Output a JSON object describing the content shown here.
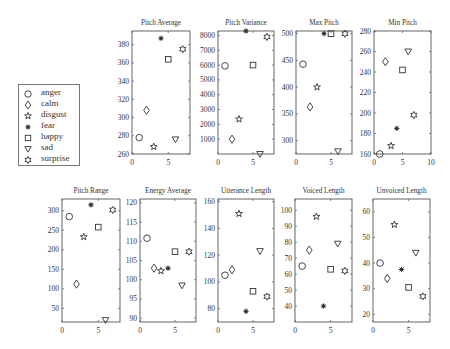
{
  "chart_data": {
    "type": "scatter",
    "layout": "small-multiples 2x5 (top row 4 panels, bottom row 5 panels)",
    "legend": {
      "position": "left",
      "entries": [
        {
          "name": "anger",
          "marker": "circle"
        },
        {
          "name": "calm",
          "marker": "diamond"
        },
        {
          "name": "disgust",
          "marker": "star"
        },
        {
          "name": "fear",
          "marker": "asterisk"
        },
        {
          "name": "happy",
          "marker": "square"
        },
        {
          "name": "sad",
          "marker": "triangle-down"
        },
        {
          "name": "surprise",
          "marker": "hexagram"
        }
      ]
    },
    "x_categories": {
      "anger": 1,
      "calm": 2,
      "disgust": 3,
      "fear": 4,
      "happy": 5,
      "sad": 6,
      "surprise": 7
    },
    "panels": [
      {
        "title": "Pitch Average",
        "xlim": [
          0,
          8
        ],
        "xticks": [
          0,
          5
        ],
        "ylim": [
          260,
          395
        ],
        "yticks": [
          260,
          280,
          300,
          320,
          340,
          360,
          380
        ],
        "points": {
          "anger": 278,
          "calm": 308,
          "disgust": 268,
          "fear": 387,
          "happy": 364,
          "sad": 276,
          "surprise": 375
        }
      },
      {
        "title": "Pitch Variance",
        "xlim": [
          0,
          8
        ],
        "xticks": [
          0,
          5
        ],
        "ylim": [
          0,
          8300
        ],
        "yticks": [
          1000,
          2000,
          3000,
          4000,
          5000,
          6000,
          7000,
          8000
        ],
        "points": {
          "anger": 5950,
          "calm": 1000,
          "disgust": 2350,
          "fear": 8300,
          "happy": 6000,
          "sad": 0,
          "surprise": 7900
        }
      },
      {
        "title": "Max Pitch",
        "xlim": [
          0,
          8
        ],
        "xticks": [
          0,
          5
        ],
        "ylim": [
          275,
          505
        ],
        "yticks": [
          300,
          350,
          400,
          450,
          500
        ],
        "points": {
          "anger": 443,
          "calm": 363,
          "disgust": 400,
          "fear": 500,
          "happy": 500,
          "sad": 280,
          "surprise": 500
        }
      },
      {
        "title": "Min Pitch",
        "xlim": [
          0,
          10
        ],
        "xticks": [
          0,
          5,
          10
        ],
        "ylim": [
          160,
          280
        ],
        "yticks": [
          160,
          180,
          200,
          220,
          240,
          260,
          280
        ],
        "points": {
          "anger": 160,
          "calm": 250,
          "disgust": 168,
          "fear": 185,
          "happy": 242,
          "sad": 260,
          "surprise": 198
        }
      },
      {
        "title": "Pitch Range",
        "xlim": [
          0,
          8
        ],
        "xticks": [
          0,
          5
        ],
        "ylim": [
          15,
          330
        ],
        "yticks": [
          50,
          100,
          150,
          200,
          250,
          300
        ],
        "points": {
          "anger": 285,
          "calm": 112,
          "disgust": 233,
          "fear": 315,
          "happy": 258,
          "sad": 20,
          "surprise": 302
        }
      },
      {
        "title": "Energy Average",
        "xlim": [
          0,
          8
        ],
        "xticks": [
          0,
          5
        ],
        "ylim": [
          89,
          121
        ],
        "yticks": [
          90,
          95,
          100,
          105,
          110,
          115,
          120
        ],
        "points": {
          "anger": 110.8,
          "calm": 103,
          "disgust": 102.3,
          "fear": 103,
          "happy": 107.3,
          "sad": 98.5,
          "surprise": 107.3
        }
      },
      {
        "title": "Utterance Length",
        "xlim": [
          0,
          8
        ],
        "xticks": [
          0,
          5
        ],
        "ylim": [
          70,
          162
        ],
        "yticks": [
          80,
          100,
          120,
          140,
          160
        ],
        "points": {
          "anger": 105,
          "calm": 109,
          "disgust": 151,
          "fear": 78,
          "happy": 93,
          "sad": 123,
          "surprise": 89
        }
      },
      {
        "title": "Voiced Length",
        "xlim": [
          0,
          8
        ],
        "xticks": [
          0,
          5
        ],
        "ylim": [
          30,
          107
        ],
        "yticks": [
          40,
          50,
          60,
          70,
          80,
          90,
          100
        ],
        "points": {
          "anger": 65,
          "calm": 75,
          "disgust": 96,
          "fear": 40,
          "happy": 63,
          "sad": 79,
          "surprise": 62
        }
      },
      {
        "title": "Unvoiced Length",
        "xlim": [
          0,
          8
        ],
        "xticks": [
          0,
          5
        ],
        "ylim": [
          17,
          65
        ],
        "yticks": [
          20,
          30,
          40,
          50,
          60
        ],
        "points": {
          "anger": 40,
          "calm": 34,
          "disgust": 55,
          "fear": 37.5,
          "happy": 30.5,
          "sad": 44,
          "surprise": 27
        }
      }
    ]
  },
  "style": {
    "axis_color": "#555555",
    "marker_color": "#333333",
    "text_color": "#333333"
  }
}
